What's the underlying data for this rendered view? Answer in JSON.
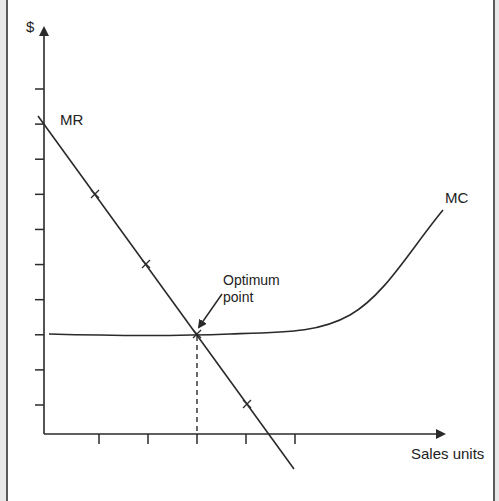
{
  "diagram": {
    "type": "economics-profit-maximization",
    "y_axis_label": "$",
    "x_axis_label": "Sales units",
    "curves": {
      "mr": {
        "label": "MR",
        "description": "Marginal revenue, downward-sloping straight line"
      },
      "mc": {
        "label": "MC",
        "description": "Marginal cost, flat then rising curve"
      }
    },
    "annotation": {
      "line1": "Optimum",
      "line2": "point",
      "description": "Arrow pointing to intersection of MR and MC"
    },
    "y_tick_count": 10,
    "x_tick_count": 5,
    "mr_marker_count": 4,
    "colors": {
      "line": "#2a2a2a",
      "text": "#222222",
      "frame": "#5a5a5a",
      "margin": "#e8e8e8"
    }
  }
}
